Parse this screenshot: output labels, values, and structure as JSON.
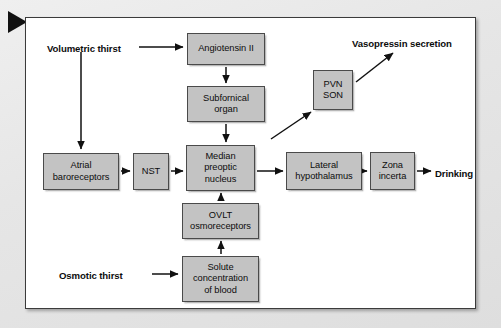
{
  "figure": {
    "marker_icon": "play-triangle-icon",
    "colors": {
      "box_fill": "#c3c3c3",
      "box_border": "#4a4a4a",
      "frame_fill": "#ffffff",
      "frame_border": "#3b3b3b",
      "page_background": "#e9e9e9",
      "arrow": "#111111",
      "text": "#0d0d0d"
    }
  },
  "labels": [
    {
      "id": "volumetric-thirst",
      "text": "Volumetric thirst",
      "x": 47,
      "y": 43
    },
    {
      "id": "osmotic-thirst",
      "text": "Osmotic thirst",
      "x": 59,
      "y": 270
    },
    {
      "id": "vasopressin-secretion",
      "text": "Vasopressin secretion",
      "x": 352,
      "y": 38
    },
    {
      "id": "drinking",
      "text": "Drinking",
      "x": 435,
      "y": 168
    }
  ],
  "nodes": [
    {
      "id": "angiotensin-ii",
      "lines": [
        "Angiotensin II"
      ],
      "x": 187,
      "y": 33,
      "w": 78,
      "h": 32
    },
    {
      "id": "subfornical-organ",
      "lines": [
        "Subfornical",
        "organ"
      ],
      "x": 187,
      "y": 86,
      "w": 78,
      "h": 36
    },
    {
      "id": "median-preoptic",
      "lines": [
        "Median",
        "preoptic",
        "nucleus"
      ],
      "x": 186,
      "y": 145,
      "w": 69,
      "h": 46
    },
    {
      "id": "ovlt-osmoreceptors",
      "lines": [
        "OVLT",
        "osmoreceptors"
      ],
      "x": 182,
      "y": 203,
      "w": 77,
      "h": 36
    },
    {
      "id": "solute-concentration",
      "lines": [
        "Solute",
        "concentration",
        "of blood"
      ],
      "x": 182,
      "y": 256,
      "w": 77,
      "h": 46
    },
    {
      "id": "atrial-baroreceptors",
      "lines": [
        "Atrial",
        "baroreceptors"
      ],
      "x": 43,
      "y": 153,
      "w": 76,
      "h": 37
    },
    {
      "id": "nst",
      "lines": [
        "NST"
      ],
      "x": 133,
      "y": 153,
      "w": 36,
      "h": 37
    },
    {
      "id": "pvn-son",
      "lines": [
        "PVN",
        "SON"
      ],
      "x": 313,
      "y": 70,
      "w": 40,
      "h": 40
    },
    {
      "id": "lateral-hypothalamus",
      "lines": [
        "Lateral",
        "hypothalamus"
      ],
      "x": 286,
      "y": 152,
      "w": 76,
      "h": 38
    },
    {
      "id": "zona-incerta",
      "lines": [
        "Zona",
        "incerta"
      ],
      "x": 370,
      "y": 152,
      "w": 45,
      "h": 38
    }
  ],
  "arrows": [
    {
      "id": "volumetric-to-angiotensin",
      "x1": 139,
      "y1": 47,
      "x2": 183,
      "y2": 47,
      "type": "straight"
    },
    {
      "id": "volumetric-to-atrial",
      "x1": 81,
      "y1": 52,
      "x2": 81,
      "y2": 149,
      "type": "straight"
    },
    {
      "id": "angiotensin-to-subfornical",
      "x1": 226,
      "y1": 67,
      "x2": 226,
      "y2": 83,
      "type": "straight"
    },
    {
      "id": "subfornical-to-median",
      "x1": 226,
      "y1": 124,
      "x2": 226,
      "y2": 142,
      "type": "straight"
    },
    {
      "id": "atrial-to-nst",
      "x1": 121,
      "y1": 171,
      "x2": 130,
      "y2": 171,
      "type": "straight"
    },
    {
      "id": "nst-to-median",
      "x1": 171,
      "y1": 171,
      "x2": 183,
      "y2": 171,
      "type": "straight"
    },
    {
      "id": "median-to-lateral",
      "x1": 257,
      "y1": 171,
      "x2": 283,
      "y2": 171,
      "type": "straight"
    },
    {
      "id": "lateral-to-zona",
      "x1": 364,
      "y1": 171,
      "x2": 367,
      "y2": 171,
      "type": "straight"
    },
    {
      "id": "zona-to-drinking",
      "x1": 417,
      "y1": 171,
      "x2": 431,
      "y2": 171,
      "type": "straight"
    },
    {
      "id": "ovlt-to-median",
      "x1": 221,
      "y1": 201,
      "x2": 221,
      "y2": 193,
      "type": "straight"
    },
    {
      "id": "solute-to-ovlt",
      "x1": 221,
      "y1": 254,
      "x2": 221,
      "y2": 241,
      "type": "straight"
    },
    {
      "id": "osmotic-to-solute",
      "x1": 152,
      "y1": 274,
      "x2": 178,
      "y2": 274,
      "type": "straight"
    },
    {
      "id": "median-area-to-pvn",
      "x1": 271,
      "y1": 139,
      "x2": 311,
      "y2": 112,
      "type": "diagonal"
    },
    {
      "id": "pvn-to-vasopressin",
      "x1": 356,
      "y1": 82,
      "x2": 393,
      "y2": 53,
      "type": "diagonal"
    }
  ]
}
